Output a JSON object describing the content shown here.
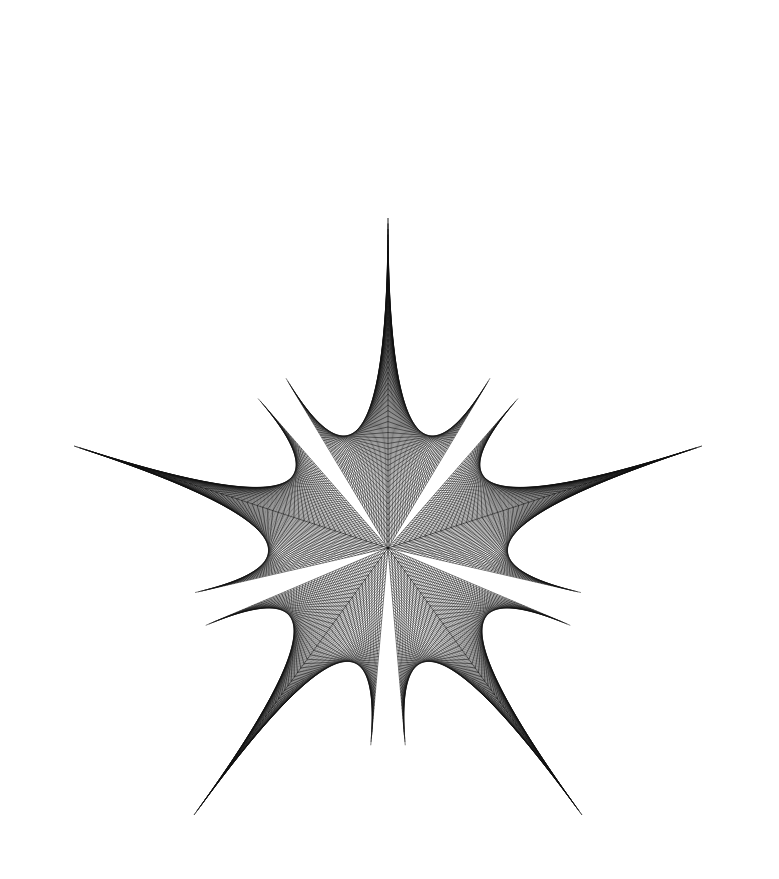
{
  "figure": {
    "title": "Five-pointed string-art star envelope",
    "background": "#ffffff",
    "stroke_color": "#111111",
    "center": [
      388,
      548
    ],
    "tip_radius": 330,
    "notch_radius": 198,
    "notch_offset_deg": 5,
    "arms": 5,
    "first_tip_angle_deg": -90,
    "lines_per_family": 60,
    "stroke_width": 0.55,
    "tips": [
      {
        "name": "top",
        "x": 388,
        "y": 218
      },
      {
        "name": "right",
        "x": 703,
        "y": 447
      },
      {
        "name": "bottom-right",
        "x": 585,
        "y": 822
      },
      {
        "name": "bottom-left",
        "x": 195,
        "y": 822
      },
      {
        "name": "left",
        "x": 74,
        "y": 451
      }
    ]
  }
}
